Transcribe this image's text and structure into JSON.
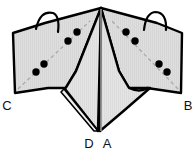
{
  "figure": {
    "type": "origami-fold-diagram",
    "title": "",
    "canvas": {
      "width": 195,
      "height": 152,
      "background": "#ffffff"
    },
    "colors": {
      "paper_fill": "#dcdcdc",
      "paper_fill_light": "#e2e2e2",
      "outline": "#000000",
      "crease_line": "#909090",
      "dot": "#000000",
      "label_text": "#111111"
    },
    "panels": [
      {
        "name": "left-wing",
        "label": "C",
        "fill": "#dcdcdc",
        "points": "101,8 45,23 13,33 15,93 48,88 66,88 75,72"
      },
      {
        "name": "right-wing",
        "label": "B",
        "fill": "#dcdcdc",
        "points": "101,8 157,23 182,33 181,93 147,88 129,88 119,72"
      },
      {
        "name": "center-left-panel",
        "fill": "#e0e0e0",
        "points": "101,8 76,71 66,88 96,131 101,131"
      },
      {
        "name": "center-right-panel",
        "fill": "#e0e0e0",
        "points": "101,8 101,131 131,95 147,88 129,88 119,72"
      },
      {
        "name": "lower-flap",
        "fill": "#e8e8e8",
        "points": "65,89 96,130 92,131 62,92"
      }
    ],
    "creases": [
      {
        "name": "center-spine",
        "from": "101,8",
        "to": "101,131",
        "style": "solid-gray"
      },
      {
        "name": "left-dashed-crease",
        "from": "18,88",
        "to": "88,22",
        "style": "dashed-gray"
      },
      {
        "name": "right-dashed-crease",
        "from": "177,88",
        "to": "114,22",
        "style": "dashed-gray"
      }
    ],
    "arcs": [
      {
        "name": "left-fold-arrow-arc",
        "cx": 46,
        "cy": 22,
        "rx": 11,
        "ry": 12
      },
      {
        "name": "right-fold-arrow-arc",
        "cx": 156,
        "cy": 22,
        "rx": 11,
        "ry": 12
      }
    ],
    "dots": [
      {
        "name": "dot-left-1",
        "cx": 77,
        "cy": 32,
        "r": 3.6
      },
      {
        "name": "dot-left-2",
        "cx": 68,
        "cy": 41,
        "r": 3.6
      },
      {
        "name": "dot-left-3",
        "cx": 44,
        "cy": 64,
        "r": 3.6
      },
      {
        "name": "dot-left-4",
        "cx": 36,
        "cy": 72,
        "r": 3.6
      },
      {
        "name": "dot-right-1",
        "cx": 126,
        "cy": 32,
        "r": 3.6
      },
      {
        "name": "dot-right-2",
        "cx": 135,
        "cy": 41,
        "r": 3.6
      },
      {
        "name": "dot-right-3",
        "cx": 159,
        "cy": 64,
        "r": 3.6
      },
      {
        "name": "dot-right-4",
        "cx": 167,
        "cy": 72,
        "r": 3.6
      }
    ],
    "labels": [
      {
        "name": "vertex-label-c",
        "text": "C",
        "x": 7,
        "y": 110
      },
      {
        "name": "vertex-label-b",
        "text": "B",
        "x": 188,
        "y": 110
      },
      {
        "name": "vertex-label-d",
        "text": "D",
        "x": 89,
        "y": 148
      },
      {
        "name": "vertex-label-a",
        "text": "A",
        "x": 107,
        "y": 148
      }
    ]
  }
}
